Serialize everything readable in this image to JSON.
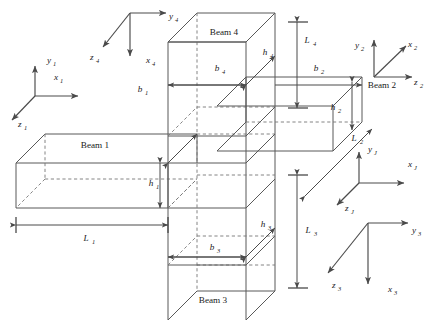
{
  "figure": {
    "type": "engineering-line-diagram",
    "background_color": "#ffffff",
    "line_color": "#595959",
    "dash_color": "#777777",
    "text_color": "#1a1a1a"
  },
  "beams": [
    {
      "id": "beam1",
      "name": "Beam 1",
      "label_x": 95,
      "label_y": 148,
      "length_label": "L",
      "length_sub": "1",
      "width_label": "b",
      "width_sub": "1",
      "height_label": "h",
      "height_sub": "1"
    },
    {
      "id": "beam2",
      "name": "Beam 2",
      "label_x": 382,
      "label_y": 88,
      "length_label": "L",
      "length_sub": "2",
      "width_label": "b",
      "width_sub": "2",
      "height_label": "h",
      "height_sub": "2"
    },
    {
      "id": "beam3",
      "name": "Beam 3",
      "label_x": 213,
      "label_y": 303,
      "length_label": "L",
      "length_sub": "3",
      "width_label": "b",
      "width_sub": "3",
      "height_label": "h",
      "height_sub": "3"
    },
    {
      "id": "beam4",
      "name": "Beam 4",
      "label_x": 224,
      "label_y": 35,
      "length_label": "L",
      "length_sub": "4",
      "width_label": "b",
      "width_sub": "4",
      "height_label": "h",
      "height_sub": "4"
    }
  ],
  "dimensions": [
    {
      "id": "L1",
      "base": "L",
      "sub": "1",
      "x": 86,
      "y": 241,
      "orientation": "horizontal"
    },
    {
      "id": "b1",
      "base": "b",
      "sub": "1",
      "x": 140,
      "y": 92,
      "orientation": "diagonal"
    },
    {
      "id": "h1",
      "base": "h",
      "sub": "1",
      "x": 151,
      "y": 186,
      "orientation": "vertical"
    },
    {
      "id": "L2",
      "base": "L",
      "sub": "2",
      "x": 354,
      "y": 141,
      "orientation": "diagonal"
    },
    {
      "id": "b2",
      "base": "b",
      "sub": "2",
      "x": 316,
      "y": 71,
      "orientation": "horizontal"
    },
    {
      "id": "h2",
      "base": "h",
      "sub": "2",
      "x": 333,
      "y": 110,
      "orientation": "vertical"
    },
    {
      "id": "L3",
      "base": "L",
      "sub": "3",
      "x": 308,
      "y": 233,
      "orientation": "vertical"
    },
    {
      "id": "b3",
      "base": "b",
      "sub": "3",
      "x": 212,
      "y": 250,
      "orientation": "horizontal"
    },
    {
      "id": "h3",
      "base": "h",
      "sub": "3",
      "x": 263,
      "y": 227,
      "orientation": "diagonal"
    },
    {
      "id": "L4",
      "base": "L",
      "sub": "4",
      "x": 307,
      "y": 43,
      "orientation": "vertical"
    },
    {
      "id": "b4",
      "base": "b",
      "sub": "4",
      "x": 217,
      "y": 71,
      "orientation": "horizontal"
    },
    {
      "id": "h4",
      "base": "h",
      "sub": "4",
      "x": 265,
      "y": 55,
      "orientation": "diagonal"
    }
  ],
  "frames": [
    {
      "id": "frame1",
      "origin_x": 35,
      "origin_y": 96,
      "axes": [
        {
          "name": "y",
          "sub": "1",
          "label_x": 47,
          "label_y": 63
        },
        {
          "name": "x",
          "sub": "1",
          "label_x": 54,
          "label_y": 80
        },
        {
          "name": "z",
          "sub": "1",
          "label_x": 18,
          "label_y": 127
        }
      ]
    },
    {
      "id": "frame2",
      "origin_x": 374,
      "origin_y": 77,
      "axes": [
        {
          "name": "y",
          "sub": "2",
          "label_x": 355,
          "label_y": 48
        },
        {
          "name": "x",
          "sub": "2",
          "label_x": 408,
          "label_y": 47
        },
        {
          "name": "z",
          "sub": "2",
          "label_x": 416,
          "label_y": 85
        }
      ]
    },
    {
      "id": "frame3",
      "origin_x": 368,
      "origin_y": 223,
      "axes": [
        {
          "name": "y",
          "sub": "3",
          "label_x": 412,
          "label_y": 233
        },
        {
          "name": "x",
          "sub": "3",
          "label_x": 388,
          "label_y": 292
        },
        {
          "name": "z",
          "sub": "3",
          "label_x": 332,
          "label_y": 288
        }
      ]
    },
    {
      "id": "frame4",
      "origin_x": 130,
      "origin_y": 13,
      "axes": [
        {
          "name": "y",
          "sub": "4",
          "label_x": 169,
          "label_y": 19
        },
        {
          "name": "x",
          "sub": "4",
          "label_x": 146,
          "label_y": 63
        },
        {
          "name": "z",
          "sub": "4",
          "label_x": 90,
          "label_y": 60
        }
      ]
    },
    {
      "id": "frameJ",
      "origin_x": 359,
      "origin_y": 183,
      "axes": [
        {
          "name": "y",
          "sub": "J",
          "label_x": 368,
          "label_y": 152
        },
        {
          "name": "x",
          "sub": "J",
          "label_x": 408,
          "label_y": 167
        },
        {
          "name": "z",
          "sub": "J",
          "label_x": 345,
          "label_y": 211
        }
      ]
    }
  ]
}
